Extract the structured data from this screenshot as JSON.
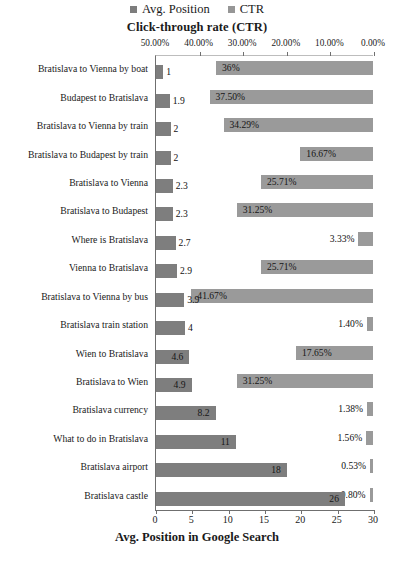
{
  "legend": {
    "items": [
      {
        "label": "Avg. Position",
        "color": "#7e7e7e",
        "icon": "square-marker-icon"
      },
      {
        "label": "CTR",
        "color": "#9a9a9a",
        "icon": "square-marker-icon"
      }
    ]
  },
  "axes": {
    "top_title": "Click-through rate (CTR)",
    "bottom_title": "Avg. Position in Google Search",
    "top_ticks": [
      "50.00%",
      "40.00%",
      "30.00%",
      "20.00%",
      "10.00%",
      "0.00%"
    ],
    "top_tick_values": [
      50,
      40,
      30,
      20,
      10,
      0
    ],
    "bottom_ticks": [
      "0",
      "5",
      "10",
      "15",
      "20",
      "25",
      "30"
    ],
    "bottom_tick_values": [
      0,
      5,
      10,
      15,
      20,
      25,
      30
    ]
  },
  "chart_data": {
    "type": "bar",
    "title": "Click-through rate (CTR)",
    "subtitle": "",
    "orientation": "horizontal-bidirectional",
    "xlabel": "Avg. Position in Google Search",
    "ylabel": "",
    "grid": false,
    "legend_position": "top-center",
    "xlim": [
      0,
      30
    ],
    "xlim_top": [
      50,
      0
    ],
    "top_axis_label": "Click-through rate (CTR)",
    "top_axis_reversed": true,
    "categories": [
      "Bratislava to Vienna by boat",
      "Budapest to Bratislava",
      "Bratislava to Vienna by train",
      "Bratislava to Budapest by train",
      "Bratislava to Vienna",
      "Bratislava to Budapest",
      "Where is Bratislava",
      "Vienna to Bratislava",
      "Bratislava to Vienna by bus",
      "Bratislava train station",
      "Wien to Bratislava",
      "Bratislava to Wien",
      "Bratislava currency",
      "What to do in Bratislava",
      "Bratislava airport",
      "Bratislava castle"
    ],
    "series": [
      {
        "name": "Avg. Position",
        "color": "#7e7e7e",
        "axis": "bottom",
        "values": [
          1,
          1.9,
          2,
          2,
          2.3,
          2.3,
          2.7,
          2.9,
          3.9,
          4,
          4.6,
          4.9,
          8.2,
          11,
          18,
          26
        ],
        "labels": [
          "1",
          "1.9",
          "2",
          "2",
          "2.3",
          "2.3",
          "2.7",
          "2.9",
          "3.9",
          "4",
          "4.6",
          "4.9",
          "8.2",
          "11",
          "18",
          "26"
        ]
      },
      {
        "name": "CTR",
        "color": "#9a9a9a",
        "axis": "top",
        "values": [
          36,
          37.5,
          34.29,
          16.67,
          25.71,
          31.25,
          3.33,
          25.71,
          41.67,
          1.4,
          17.65,
          31.25,
          1.38,
          1.56,
          0.53,
          0.8
        ],
        "labels": [
          "36%",
          "37.50%",
          "34.29%",
          "16.67%",
          "25.71%",
          "31.25%",
          "3.33%",
          "25.71%",
          "41.67%",
          "1.40%",
          "17.65%",
          "31.25%",
          "1.38%",
          "1.56%",
          "0.53%",
          "0.80%"
        ]
      }
    ]
  }
}
